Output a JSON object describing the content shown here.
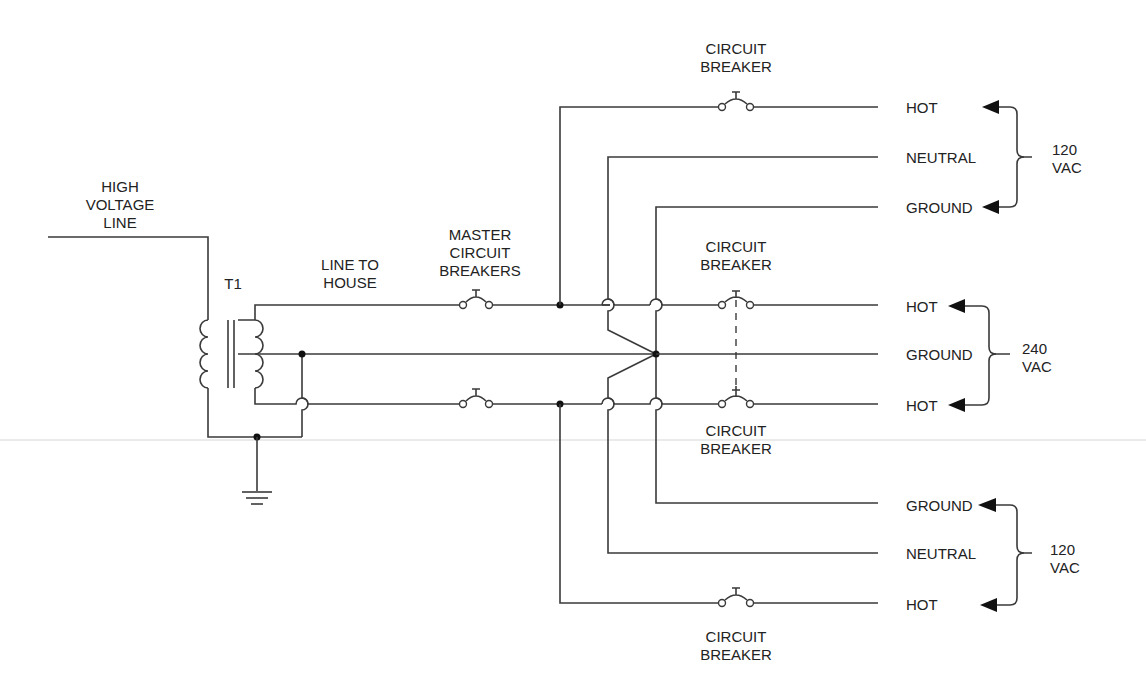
{
  "diagram": {
    "colors": {
      "wire": "#3a3a3a",
      "text": "#222222",
      "node": "#111111"
    },
    "source": {
      "label_lines": [
        "HIGH",
        "VOLTAGE",
        "LINE"
      ],
      "transformer_label": "T1",
      "line_label_lines": [
        "LINE TO",
        "HOUSE"
      ],
      "master_breaker_label_lines": [
        "MASTER",
        "CIRCUIT",
        "BREAKERS"
      ]
    },
    "breakers": {
      "top": [
        "CIRCUIT",
        "BREAKER"
      ],
      "mid_upper": [
        "CIRCUIT",
        "BREAKER"
      ],
      "mid_lower": [
        "CIRCUIT",
        "BREAKER"
      ],
      "bottom": [
        "CIRCUIT",
        "BREAKER"
      ]
    },
    "outputs": {
      "group1": {
        "terminals": [
          "HOT",
          "NEUTRAL",
          "GROUND"
        ],
        "voltage": [
          "120",
          "VAC"
        ]
      },
      "group2": {
        "terminals": [
          "HOT",
          "GROUND",
          "HOT"
        ],
        "voltage": [
          "240",
          "VAC"
        ]
      },
      "group3": {
        "terminals": [
          "GROUND",
          "NEUTRAL",
          "HOT"
        ],
        "voltage": [
          "120",
          "VAC"
        ]
      }
    }
  }
}
